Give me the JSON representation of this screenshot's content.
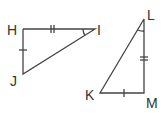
{
  "diagram": {
    "stroke_color": "#444444",
    "triangles": [
      {
        "name": "HIJ",
        "vertices": {
          "H": {
            "label": "H",
            "x": 23,
            "y": 29
          },
          "I": {
            "label": "I",
            "x": 95,
            "y": 29
          },
          "J": {
            "label": "J",
            "x": 23,
            "y": 74
          }
        },
        "right_angle_at": "H",
        "marks": {
          "HI": "double tick",
          "HJ": "single tick",
          "angle_I": "arc"
        }
      },
      {
        "name": "KLM",
        "vertices": {
          "K": {
            "label": "K",
            "x": 100,
            "y": 93
          },
          "L": {
            "label": "L",
            "x": 144,
            "y": 19
          },
          "M": {
            "label": "M",
            "x": 144,
            "y": 93
          }
        },
        "right_angle_at": "M",
        "marks": {
          "LM": "double tick",
          "KM": "single tick",
          "angle_L": "arc"
        }
      }
    ]
  }
}
